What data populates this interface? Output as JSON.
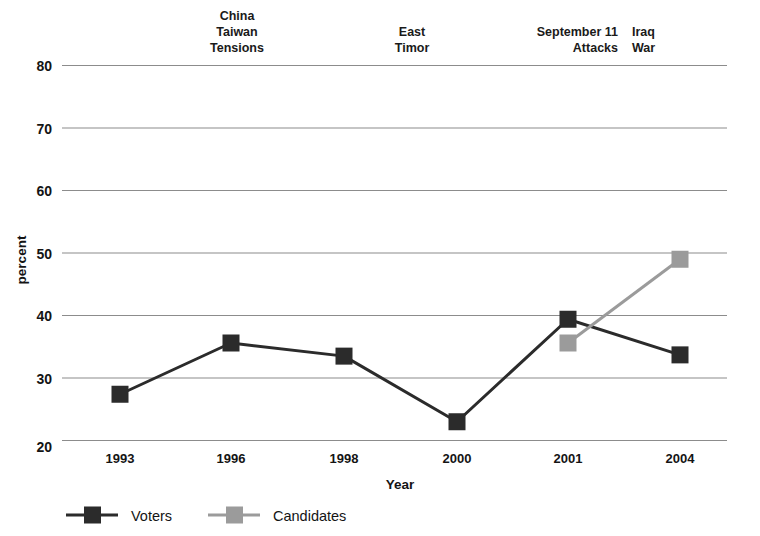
{
  "chart_data": {
    "type": "line",
    "title": "",
    "xlabel": "Year",
    "ylabel": "percent",
    "categories": [
      "1993",
      "1996",
      "1998",
      "2000",
      "2001",
      "2004"
    ],
    "ylim": [
      20,
      80
    ],
    "yticks": [
      20,
      30,
      40,
      50,
      60,
      70,
      80
    ],
    "grid": true,
    "legend_position": "bottom-left",
    "series": [
      {
        "name": "Voters",
        "color": "#2b2b2b",
        "values": [
          27.4,
          35.6,
          33.5,
          23.0,
          39.4,
          33.7
        ]
      },
      {
        "name": "Candidates",
        "color": "#9b9b9b",
        "values": [
          null,
          null,
          null,
          null,
          35.6,
          49.0
        ]
      }
    ],
    "annotations": [
      {
        "text_lines": [
          "China",
          "Taiwan",
          "Tensions"
        ],
        "align": "center",
        "x_category": "1996"
      },
      {
        "text_lines": [
          "East",
          "Timor"
        ],
        "align": "center",
        "x_category": "1998"
      },
      {
        "text_lines": [
          "September 11",
          "Attacks"
        ],
        "align": "right",
        "x_category": "2001"
      },
      {
        "text_lines": [
          "Iraq",
          "War"
        ],
        "align": "left",
        "x_category": "2004"
      }
    ]
  },
  "axis": {
    "ytick_labels": [
      "80",
      "70",
      "60",
      "50",
      "40",
      "30",
      "20"
    ],
    "xtick_labels": [
      "1993",
      "1996",
      "1998",
      "2000",
      "2001",
      "2004"
    ],
    "y_title": "percent",
    "x_title": "Year"
  },
  "legend": {
    "items": [
      {
        "label": "Voters",
        "color": "#2b2b2b"
      },
      {
        "label": "Candidates",
        "color": "#9b9b9b"
      }
    ]
  },
  "annotations": {
    "china_taiwan": [
      "China",
      "Taiwan",
      "Tensions"
    ],
    "east_timor": [
      "East",
      "Timor"
    ],
    "september11": [
      "September 11",
      "Attacks"
    ],
    "iraq_war": [
      "Iraq",
      "War"
    ]
  },
  "colors": {
    "voters": "#2b2b2b",
    "candidates": "#9b9b9b",
    "gridline": "#8c8c8c",
    "background": "#ffffff"
  }
}
